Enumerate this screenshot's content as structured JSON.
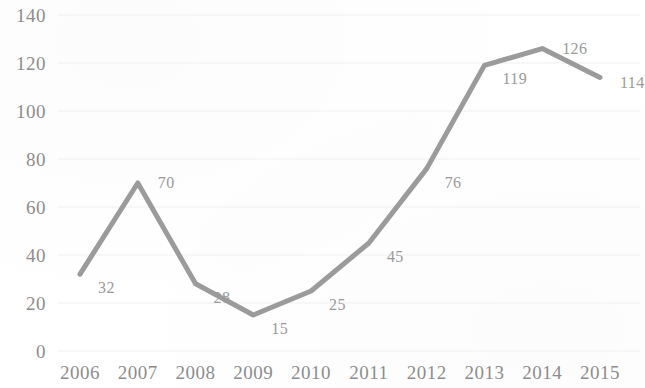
{
  "chart_data": {
    "type": "line",
    "title": "",
    "subtitle": "",
    "xlabel": "",
    "ylabel": "",
    "categories": [
      "2006",
      "2007",
      "2008",
      "2009",
      "2010",
      "2011",
      "2012",
      "2013",
      "2014",
      "2015"
    ],
    "values": [
      32,
      70,
      28,
      15,
      25,
      45,
      76,
      119,
      126,
      114
    ],
    "point_labels": [
      "32",
      "70",
      "28",
      "15",
      "25",
      "45",
      "76",
      "119",
      "126",
      "114"
    ],
    "series": [
      {
        "name": "",
        "values": [
          32,
          70,
          28,
          15,
          25,
          45,
          76,
          119,
          126,
          114
        ],
        "color": "#9b9b9b"
      }
    ],
    "ylim": [
      0,
      140
    ],
    "ytick_values": [
      0,
      20,
      40,
      60,
      80,
      100,
      120,
      140
    ],
    "ytick_labels": [
      "0",
      "20",
      "40",
      "60",
      "80",
      "100",
      "120",
      "140"
    ],
    "xtick_labels": [
      "2006",
      "2007",
      "2008",
      "2009",
      "2010",
      "2011",
      "2012",
      "2013",
      "2014",
      "2015"
    ],
    "grid": {
      "horizontal": true,
      "vertical": false,
      "color": "#f0f0f0"
    },
    "legend": {
      "visible": false,
      "position": "none",
      "entries": []
    },
    "annotations": [],
    "line_style": {
      "color": "#9b9b9b",
      "width": 5,
      "markers": false
    },
    "axis_text_color": "#8d8d8d",
    "label_text_color": "#9a9a9a",
    "background_color": "#ffffff"
  }
}
